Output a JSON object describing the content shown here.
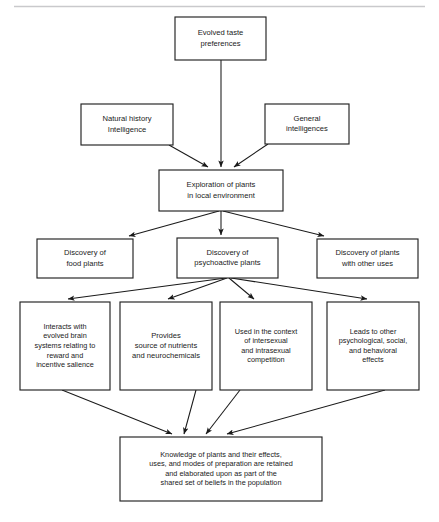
{
  "diagram": {
    "top_rule": true,
    "colors": {
      "box_stroke": "#222222",
      "box_fill": "#ffffff",
      "edge": "#1a1a1a",
      "text": "#1a1a1a",
      "rule": "#c9c9cc",
      "background": "#ffffff"
    },
    "nodes": {
      "evolved_taste": {
        "lines": [
          "Evolved taste",
          "preferences"
        ],
        "x": 175,
        "y": 17,
        "w": 91,
        "h": 43
      },
      "natural_history": {
        "lines": [
          "Natural history",
          "Intelligence"
        ],
        "x": 81,
        "y": 104,
        "w": 92,
        "h": 41
      },
      "general_intelligences": {
        "lines": [
          "General",
          "intelligences"
        ],
        "x": 265,
        "y": 104,
        "w": 84,
        "h": 40
      },
      "exploration": {
        "lines": [
          "Exploration of plants",
          "in local environment"
        ],
        "x": 159,
        "y": 170,
        "w": 124,
        "h": 41
      },
      "food_plants": {
        "lines": [
          "Discovery of",
          "food plants"
        ],
        "x": 37,
        "y": 239,
        "w": 96,
        "h": 39
      },
      "psychoactive_plants": {
        "lines": [
          "Discovery of",
          "psychoactive plants"
        ],
        "x": 177,
        "y": 238,
        "w": 101,
        "h": 40
      },
      "other_uses": {
        "lines": [
          "Discovery of plants",
          "with other uses"
        ],
        "x": 317,
        "y": 239,
        "w": 101,
        "h": 39
      },
      "interacts_brain": {
        "lines": [
          "Interacts with",
          "evolved brain",
          "systems relating to",
          "reward and",
          "incentive salience"
        ],
        "x": 20,
        "y": 302,
        "w": 90,
        "h": 88
      },
      "nutrients": {
        "lines": [
          "Provides",
          "source of nutrients",
          "and neurochemicals"
        ],
        "x": 120,
        "y": 302,
        "w": 92,
        "h": 88
      },
      "intersexual": {
        "lines": [
          "Used in the context",
          "of intersexual",
          "and intrasexual",
          "competition"
        ],
        "x": 220,
        "y": 302,
        "w": 92,
        "h": 88
      },
      "other_effects": {
        "lines": [
          "Leads to other",
          "psychological, social,",
          "and behavioral",
          "effects"
        ],
        "x": 327,
        "y": 302,
        "w": 92,
        "h": 88
      },
      "knowledge": {
        "lines": [
          "Knowledge of plants and their effects,",
          "uses, and modes of preparation are retained",
          "and elaborated upon as part of the",
          "shared set of beliefs in the population"
        ],
        "x": 120,
        "y": 437,
        "w": 202,
        "h": 64
      }
    },
    "edges": [
      {
        "name": "evolved-taste-to-exploration",
        "from": "evolved_taste",
        "to": "exploration"
      },
      {
        "name": "natural-history-to-exploration",
        "from": "natural_history",
        "to": "exploration"
      },
      {
        "name": "general-intelligences-to-exploration",
        "from": "general_intelligences",
        "to": "exploration"
      },
      {
        "name": "exploration-to-food-plants",
        "from": "exploration",
        "to": "food_plants"
      },
      {
        "name": "exploration-to-psychoactive-plants",
        "from": "exploration",
        "to": "psychoactive_plants"
      },
      {
        "name": "exploration-to-other-uses",
        "from": "exploration",
        "to": "other_uses"
      },
      {
        "name": "psychoactive-to-interacts-brain",
        "from": "psychoactive_plants",
        "to": "interacts_brain"
      },
      {
        "name": "psychoactive-to-nutrients",
        "from": "psychoactive_plants",
        "to": "nutrients"
      },
      {
        "name": "psychoactive-to-intersexual",
        "from": "psychoactive_plants",
        "to": "intersexual"
      },
      {
        "name": "psychoactive-to-other-effects",
        "from": "psychoactive_plants",
        "to": "other_effects"
      },
      {
        "name": "interacts-brain-to-knowledge",
        "from": "interacts_brain",
        "to": "knowledge"
      },
      {
        "name": "nutrients-to-knowledge",
        "from": "nutrients",
        "to": "knowledge"
      },
      {
        "name": "intersexual-to-knowledge",
        "from": "intersexual",
        "to": "knowledge"
      },
      {
        "name": "other-effects-to-knowledge",
        "from": "other_effects",
        "to": "knowledge"
      }
    ]
  }
}
